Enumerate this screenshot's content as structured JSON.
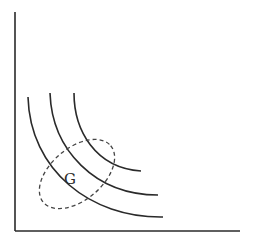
{
  "diagram": {
    "type": "indifference-curves",
    "colors": {
      "line": "#2a2a2a",
      "dashed": "#444444",
      "background": "#ffffff"
    },
    "axes": {
      "origin": [
        15,
        231
      ],
      "y_top": 12,
      "x_right": 240
    },
    "curves": [
      {
        "name": "inner",
        "d": "M74,93 C74,130 95,168 141,171"
      },
      {
        "name": "middle",
        "d": "M50,93 C52,150 95,195 158,195"
      },
      {
        "name": "outer",
        "d": "M28,97 C30,170 90,218 163,217"
      }
    ],
    "region": {
      "label": "G",
      "label_pos": [
        64,
        184
      ],
      "cx": 77,
      "cy": 174,
      "rx": 44,
      "ry": 26,
      "rotate": -40
    }
  }
}
